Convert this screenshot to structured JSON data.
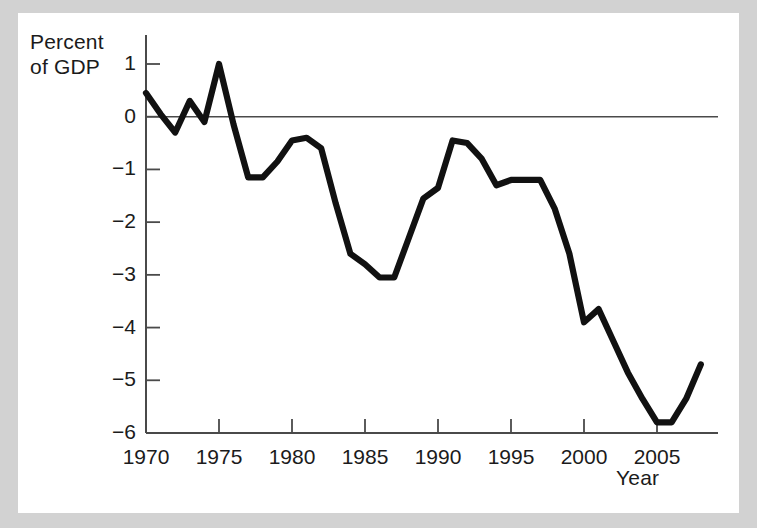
{
  "figure": {
    "background_color": "#ffffff",
    "page_color": "#d2d2d2",
    "line_color": "#111111",
    "axis_color": "#4a4a4a"
  },
  "labels": {
    "y_axis_title_line1": "Percent",
    "y_axis_title_line2": "of GDP",
    "x_axis_title": "Year"
  },
  "chart_data": {
    "type": "line",
    "title": "",
    "subtitle": "",
    "xlabel": "Year",
    "ylabel": "Percent of GDP",
    "xlim": [
      1970,
      2008
    ],
    "ylim": [
      -6,
      1.4
    ],
    "grid": false,
    "legend": "none",
    "zero_line": 0,
    "x_ticks": [
      1970,
      1975,
      1980,
      1985,
      1990,
      1995,
      2000,
      2005
    ],
    "x_tick_labels": [
      "1970",
      "1975",
      "1980",
      "1985",
      "1990",
      "1995",
      "2000",
      "2005"
    ],
    "y_ticks": [
      1,
      0,
      -1,
      -2,
      -3,
      -4,
      -5,
      -6
    ],
    "y_tick_labels": [
      "1",
      "0",
      "−1",
      "−2",
      "−3",
      "−4",
      "−5",
      "−6"
    ],
    "series": [
      {
        "name": "Budget surplus/deficit as percent of GDP",
        "x": [
          1970,
          1971,
          1972,
          1973,
          1974,
          1975,
          1976,
          1977,
          1978,
          1979,
          1980,
          1981,
          1982,
          1983,
          1984,
          1985,
          1986,
          1987,
          1988,
          1989,
          1990,
          1991,
          1992,
          1993,
          1994,
          1995,
          1996,
          1997,
          1998,
          1999,
          2000,
          2001,
          2002,
          2003,
          2004,
          2005,
          2006,
          2007,
          2008
        ],
        "y": [
          0.45,
          0.05,
          -0.3,
          0.3,
          -0.1,
          1.0,
          -0.15,
          -1.15,
          -1.15,
          -0.85,
          -0.45,
          -0.4,
          -0.6,
          -1.65,
          -2.6,
          -2.8,
          -3.05,
          -3.05,
          -2.3,
          -1.55,
          -1.35,
          -0.45,
          -0.5,
          -0.8,
          -1.3,
          -1.2,
          -1.2,
          -1.2,
          -1.75,
          -2.6,
          -3.9,
          -3.65,
          -4.25,
          -4.85,
          -5.35,
          -5.8,
          -5.8,
          -5.35,
          -4.7
        ]
      }
    ]
  }
}
